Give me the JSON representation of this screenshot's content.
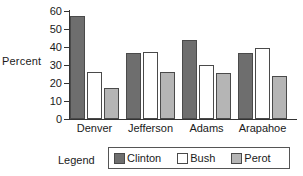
{
  "chart_data": {
    "type": "bar",
    "title": "",
    "xlabel": "",
    "ylabel": "Percent",
    "ylim": [
      0,
      60
    ],
    "yticks": [
      0,
      10,
      20,
      30,
      40,
      50,
      60
    ],
    "grid": false,
    "legend_position": "bottom",
    "legend_title": "Legend",
    "categories": [
      "Denver",
      "Jefferson",
      "Adams",
      "Arapahoe"
    ],
    "series": [
      {
        "name": "Clinton",
        "color": "#6e6e6e",
        "values": [
          57,
          36.5,
          44,
          36.5
        ]
      },
      {
        "name": "Bush",
        "color": "#ffffff",
        "values": [
          26,
          37.5,
          30,
          39.5
        ]
      },
      {
        "name": "Perot",
        "color": "#b5b5b5",
        "values": [
          17.5,
          26,
          25.5,
          24
        ]
      }
    ]
  }
}
